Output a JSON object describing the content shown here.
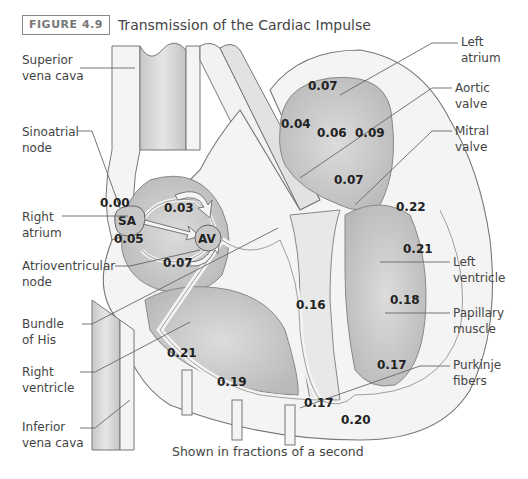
{
  "figure": {
    "badge": "FIGURE 4.9",
    "title": "Transmission of the Cardiac Impulse",
    "caption": "Shown in fractions of a second"
  },
  "labels": {
    "left": [
      {
        "line1": "Superior",
        "line2": "vena cava"
      },
      {
        "line1": "Sinoatrial",
        "line2": "node"
      },
      {
        "line1": "Right",
        "line2": "atrium"
      },
      {
        "line1": "Atrioventricular",
        "line2": "node"
      },
      {
        "line1": "Bundle",
        "line2": "of His"
      },
      {
        "line1": "Right",
        "line2": "ventricle"
      },
      {
        "line1": "Inferior",
        "line2": "vena cava"
      }
    ],
    "right": [
      {
        "line1": "Left",
        "line2": "atrium"
      },
      {
        "line1": "Aortic",
        "line2": "valve"
      },
      {
        "line1": "Mitral",
        "line2": "valve"
      },
      {
        "line1": "Left",
        "line2": "ventricle"
      },
      {
        "line1": "Papillary",
        "line2": "muscle"
      },
      {
        "line1": "Purkinje",
        "line2": "fibers"
      }
    ]
  },
  "nodes": {
    "sa": "SA",
    "av": "AV"
  },
  "timings": [
    {
      "id": "sa",
      "value": "0.00"
    },
    {
      "id": "ra-av",
      "value": "0.03"
    },
    {
      "id": "ra-low",
      "value": "0.05"
    },
    {
      "id": "av-out",
      "value": "0.07"
    },
    {
      "id": "la-top",
      "value": "0.07"
    },
    {
      "id": "la-left",
      "value": "0.04"
    },
    {
      "id": "la-mid",
      "value": "0.06"
    },
    {
      "id": "la-right",
      "value": "0.09"
    },
    {
      "id": "la-bottom",
      "value": "0.07"
    },
    {
      "id": "lv-top",
      "value": "0.22"
    },
    {
      "id": "lv-upper",
      "value": "0.21"
    },
    {
      "id": "lv-mid",
      "value": "0.18"
    },
    {
      "id": "septum",
      "value": "0.16"
    },
    {
      "id": "lv-low",
      "value": "0.17"
    },
    {
      "id": "rv-upper",
      "value": "0.21"
    },
    {
      "id": "rv-low",
      "value": "0.19"
    },
    {
      "id": "apex",
      "value": "0.17"
    },
    {
      "id": "apex-outer",
      "value": "0.20"
    }
  ]
}
